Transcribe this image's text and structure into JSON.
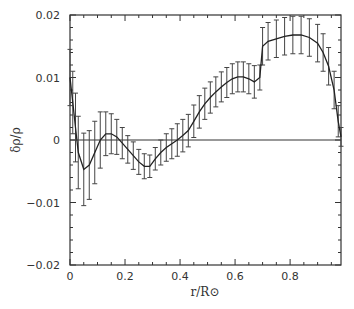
{
  "chart_data": {
    "type": "line",
    "title": "",
    "xlabel": "r/R⊙",
    "ylabel": "δρ/ρ",
    "xlim": [
      0,
      0.985
    ],
    "ylim": [
      -0.02,
      0.02
    ],
    "grid": false,
    "legend": null,
    "x_ticks": [
      0,
      0.2,
      0.4,
      0.6,
      0.8
    ],
    "x_tick_labels": [
      "0",
      "0.2",
      "0.4",
      "0.6",
      "0.8"
    ],
    "y_ticks": [
      -0.02,
      -0.01,
      0,
      0.01,
      0.02
    ],
    "y_tick_labels": [
      "-0.02",
      "-0.01",
      "0",
      "0.01",
      "0.02"
    ],
    "reference_line": {
      "y": 0
    },
    "series": [
      {
        "name": "relative sound-speed/density difference",
        "x": [
          0.0,
          0.01,
          0.02,
          0.03,
          0.05,
          0.07,
          0.09,
          0.11,
          0.13,
          0.15,
          0.17,
          0.19,
          0.21,
          0.23,
          0.25,
          0.27,
          0.29,
          0.31,
          0.33,
          0.35,
          0.37,
          0.39,
          0.41,
          0.43,
          0.45,
          0.47,
          0.49,
          0.51,
          0.53,
          0.55,
          0.57,
          0.59,
          0.61,
          0.63,
          0.65,
          0.67,
          0.69,
          0.7,
          0.72,
          0.75,
          0.78,
          0.81,
          0.84,
          0.87,
          0.9,
          0.92,
          0.94,
          0.96,
          0.975,
          0.985
        ],
        "y": [
          0.01,
          0.006,
          0.002,
          -0.002,
          -0.0047,
          -0.004,
          -0.002,
          0.0,
          0.001,
          0.001,
          0.0005,
          -0.0005,
          -0.0015,
          -0.0025,
          -0.0035,
          -0.0042,
          -0.0042,
          -0.003,
          -0.002,
          -0.0012,
          -0.0006,
          0.0,
          0.0007,
          0.0015,
          0.003,
          0.0045,
          0.0058,
          0.0068,
          0.0077,
          0.0085,
          0.0092,
          0.0098,
          0.0101,
          0.0101,
          0.0098,
          0.0093,
          0.01,
          0.015,
          0.0158,
          0.0162,
          0.0166,
          0.0168,
          0.0168,
          0.0164,
          0.0155,
          0.014,
          0.0118,
          0.008,
          0.003,
          0.0005
        ],
        "error": [
          0.0045,
          0.005,
          0.0055,
          0.0058,
          0.0058,
          0.0055,
          0.005,
          0.0045,
          0.0035,
          0.0032,
          0.0028,
          0.0025,
          0.0022,
          0.0022,
          0.002,
          0.002,
          0.0018,
          0.0018,
          0.002,
          0.0022,
          0.0024,
          0.0026,
          0.0026,
          0.0026,
          0.0026,
          0.0026,
          0.0025,
          0.0025,
          0.0024,
          0.0024,
          0.0024,
          0.0024,
          0.0024,
          0.0024,
          0.0024,
          0.0026,
          0.002,
          0.003,
          0.003,
          0.003,
          0.003,
          0.003,
          0.003,
          0.003,
          0.003,
          0.003,
          0.003,
          0.003,
          0.0025,
          0.0015
        ]
      }
    ]
  }
}
